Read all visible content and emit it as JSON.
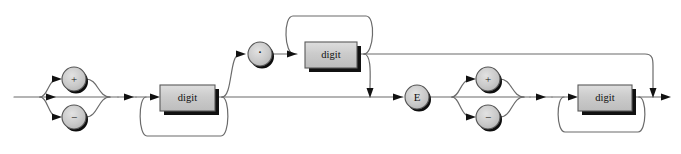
{
  "diagram": {
    "kind": "railroad-syntax-diagram",
    "colors": {
      "line": "#6b6b6b",
      "arrow": "#111111",
      "box_fill": "#c9c9c9",
      "box_fill_light": "#d5d5d5",
      "box_stroke": "#5a5a5a",
      "box_shadow": "#111111",
      "circle_fill": "#c9c9c9",
      "circle_stroke": "#555555",
      "circle_shadow": "#0d0d0d",
      "text": "#101010",
      "background": "#ffffff"
    },
    "nodes": [
      {
        "id": "sign-plus-left",
        "shape": "circle",
        "label": "+",
        "cx": 74,
        "cy": 79,
        "r": 12
      },
      {
        "id": "sign-minus-left",
        "shape": "circle",
        "label": "−",
        "cx": 74,
        "cy": 117,
        "r": 12
      },
      {
        "id": "digit-integer",
        "shape": "box",
        "label": "digit",
        "x": 160,
        "y": 85,
        "w": 55,
        "h": 26
      },
      {
        "id": "decimal-point",
        "shape": "circle",
        "label": "·",
        "cx": 260,
        "cy": 54,
        "r": 12
      },
      {
        "id": "digit-fraction",
        "shape": "box",
        "label": "digit",
        "x": 305,
        "y": 42,
        "w": 52,
        "h": 26
      },
      {
        "id": "exponent-e",
        "shape": "circle",
        "label": "E",
        "cx": 417,
        "cy": 97,
        "r": 12
      },
      {
        "id": "sign-plus-right",
        "shape": "circle",
        "label": "+",
        "cx": 488,
        "cy": 79,
        "r": 12
      },
      {
        "id": "sign-minus-right",
        "shape": "circle",
        "label": "−",
        "cx": 488,
        "cy": 117,
        "r": 12
      },
      {
        "id": "digit-exponent",
        "shape": "box",
        "label": "digit",
        "x": 578,
        "y": 85,
        "w": 54,
        "h": 26
      }
    ],
    "labels": {
      "plus": "+",
      "minus": "−",
      "digit": "digit",
      "decimal_point": "·",
      "exponent": "E"
    },
    "ghost_header_text": ""
  }
}
